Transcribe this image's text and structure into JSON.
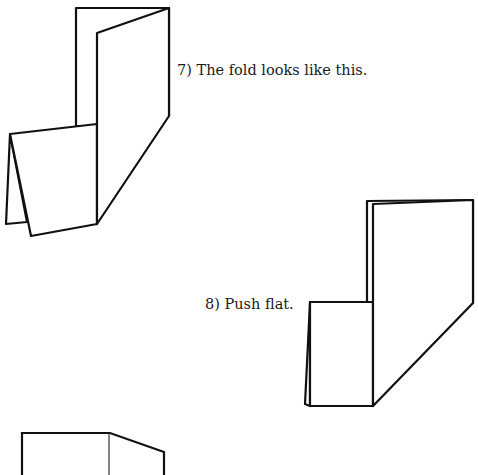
{
  "steps": [
    {
      "number": "7",
      "caption": "7) The fold looks like this."
    },
    {
      "number": "8",
      "caption": "8) Push flat."
    },
    {
      "number": "9",
      "caption": ""
    }
  ],
  "colors": {
    "background": "#ffffff",
    "line": "#111111",
    "text": "#1a1a1a"
  }
}
